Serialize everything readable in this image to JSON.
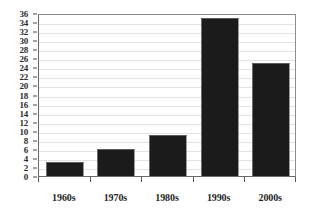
{
  "chart_data": {
    "type": "bar",
    "title": "",
    "subtitle": "",
    "xlabel": "",
    "ylabel": "",
    "categories": [
      "1960s",
      "1970s",
      "1980s",
      "1990s",
      "2000s"
    ],
    "values": [
      3,
      6,
      9,
      35,
      25
    ],
    "ylim": [
      0,
      36
    ],
    "ytick_step": 2,
    "yticks": [
      0,
      2,
      4,
      6,
      8,
      10,
      12,
      14,
      16,
      18,
      20,
      22,
      24,
      26,
      28,
      30,
      32,
      34,
      36
    ],
    "ytick_labels": [
      "0",
      "2",
      "4",
      "6",
      "8",
      "10",
      "12",
      "14",
      "16",
      "18",
      "20",
      "22",
      "24",
      "26",
      "28",
      "30",
      "32",
      "34",
      "36"
    ],
    "grid": true,
    "grid_axis": "y",
    "legend": false,
    "legend_position": "none",
    "annotations": [],
    "colors": {
      "bar_fill": "#1b1b1b",
      "bar_edge": "#6d6d6d",
      "gridline": "#e2e2e2",
      "axis": "#6a6a6a",
      "plot_border": "#8d8d8d",
      "tick_label": "#2b2b2b",
      "category_label": "#1f1f1f",
      "background": "#ffffff"
    }
  }
}
